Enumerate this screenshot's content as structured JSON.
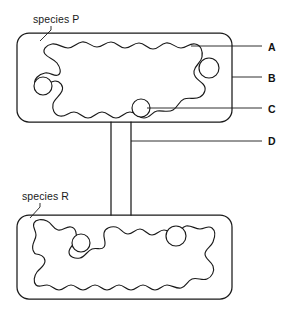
{
  "figure": {
    "line_color": "#1a1a1a",
    "background_color": "#ffffff",
    "fill_color": "#ffffff"
  },
  "species_labels": [
    {
      "id": "species-p",
      "text": "species P",
      "x": 33,
      "y": 13
    },
    {
      "id": "species-r",
      "text": "species R",
      "x": 22,
      "y": 190
    }
  ],
  "key_labels": [
    {
      "id": "label-a",
      "text": "A",
      "x": 268,
      "y": 41
    },
    {
      "id": "label-b",
      "text": "B",
      "x": 268,
      "y": 72
    },
    {
      "id": "label-c",
      "text": "C",
      "x": 268,
      "y": 103
    },
    {
      "id": "label-d",
      "text": "D",
      "x": 268,
      "y": 135
    }
  ],
  "leader_lines": [
    {
      "id": "leader-species-p",
      "d": "M 51 26 L 51 30 L 40 41"
    },
    {
      "id": "leader-species-r",
      "d": "M 40 203 L 40 207 L 30 218"
    },
    {
      "id": "leader-a",
      "d": "M 191 46 L 262 46"
    },
    {
      "id": "leader-b",
      "d": "M 232 77 L 262 77"
    },
    {
      "id": "leader-c",
      "d": "M 147 108 L 262 108"
    },
    {
      "id": "leader-d",
      "d": "M 131 141 L 262 141"
    }
  ],
  "shapes": {
    "box_p": {
      "name": "habitat-patch-p",
      "x": 17,
      "y": 33,
      "width": 215,
      "height": 89,
      "corner_radius": 12
    },
    "box_r": {
      "name": "habitat-patch-r",
      "x": 17,
      "y": 215,
      "width": 215,
      "height": 84,
      "corner_radius": 12
    },
    "corridor": {
      "name": "corridor",
      "left_wall_x": 111,
      "right_wall_x": 131,
      "top_y": 122,
      "bottom_y": 215
    }
  },
  "organelles": [
    {
      "id": "circle-p-1",
      "cx": 209,
      "cy": 68,
      "r": 10
    },
    {
      "id": "circle-p-2",
      "cx": 43,
      "cy": 86,
      "r": 9
    },
    {
      "id": "circle-p-3",
      "cx": 141,
      "cy": 108,
      "r": 9
    },
    {
      "id": "circle-r-1",
      "cx": 81,
      "cy": 243,
      "r": 9
    },
    {
      "id": "circle-r-2",
      "cx": 176,
      "cy": 236,
      "r": 10
    }
  ]
}
